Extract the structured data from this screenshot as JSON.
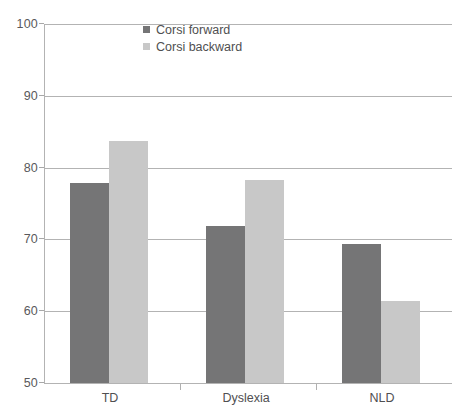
{
  "chart_data": {
    "type": "bar",
    "title": "",
    "xlabel": "",
    "ylabel": "",
    "categories": [
      "TD",
      "Dyslexia",
      "NLD"
    ],
    "series": [
      {
        "name": "Corsi forward",
        "color": "#757576",
        "values": [
          77.8,
          71.8,
          69.3
        ]
      },
      {
        "name": "Corsi backward",
        "color": "#c8c8c8",
        "values": [
          83.7,
          78.3,
          61.4
        ]
      }
    ],
    "ylim": [
      50,
      100
    ],
    "yticks": [
      50,
      60,
      70,
      80,
      90,
      100
    ],
    "ytick_labels": [
      "50",
      "60",
      "70",
      "80",
      "90",
      "100"
    ],
    "grid": "horizontal",
    "legend_position": "top-center"
  },
  "legend": {
    "items": [
      {
        "label": "Corsi forward"
      },
      {
        "label": "Corsi backward"
      }
    ]
  },
  "axis": {
    "y": {
      "labels": [
        "100",
        "90",
        "80",
        "70",
        "60",
        "50"
      ]
    },
    "x": {
      "labels": [
        "TD",
        "Dyslexia",
        "NLD"
      ]
    }
  },
  "colors": {
    "forward": "#757576",
    "backward": "#c8c8c8",
    "gridline": "#b3b3b3",
    "text": "#4f4f51",
    "background": "#ffffff"
  }
}
